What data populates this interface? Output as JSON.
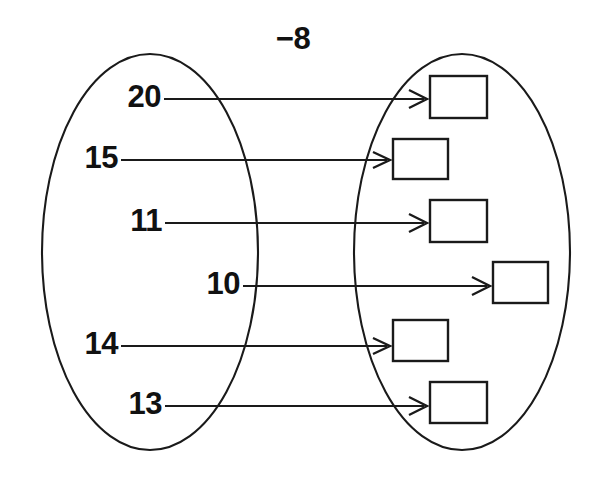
{
  "diagram": {
    "type": "mapping-diagram",
    "rule_label": "−8",
    "left_set": {
      "name": "input-set",
      "items": [
        {
          "label": "20",
          "label_x": 161,
          "label_y": 99,
          "line_y": 99,
          "line_x1": 164,
          "line_x2": 424
        },
        {
          "label": "15",
          "label_x": 118,
          "label_y": 160,
          "line_y": 160,
          "line_x1": 121,
          "line_x2": 387
        },
        {
          "label": "11",
          "label_x": 162,
          "label_y": 223,
          "line_y": 223,
          "line_x1": 165,
          "line_x2": 424
        },
        {
          "label": "10",
          "label_x": 240,
          "label_y": 286,
          "line_y": 286,
          "line_x1": 243,
          "line_x2": 487
        },
        {
          "label": "14",
          "label_x": 118,
          "label_y": 346,
          "line_y": 346,
          "line_x1": 121,
          "line_x2": 387
        },
        {
          "label": "13",
          "label_x": 162,
          "label_y": 406,
          "line_y": 406,
          "line_x1": 165,
          "line_x2": 424
        }
      ]
    },
    "right_set": {
      "name": "output-set",
      "boxes": [
        {
          "id": "output-box-1",
          "value": "",
          "x": 430,
          "y": 76,
          "w": 57,
          "h": 42
        },
        {
          "id": "output-box-2",
          "value": "",
          "x": 393,
          "y": 139,
          "w": 55,
          "h": 40
        },
        {
          "id": "output-box-3",
          "value": "",
          "x": 430,
          "y": 200,
          "w": 57,
          "h": 42
        },
        {
          "id": "output-box-4",
          "value": "",
          "x": 493,
          "y": 262,
          "w": 55,
          "h": 41
        },
        {
          "id": "output-box-5",
          "value": "",
          "x": 393,
          "y": 320,
          "w": 55,
          "h": 41
        },
        {
          "id": "output-box-6",
          "value": "",
          "x": 430,
          "y": 382,
          "w": 57,
          "h": 41
        }
      ]
    },
    "ellipses": {
      "left": {
        "cx": 150,
        "cy": 252,
        "rx": 108,
        "ry": 198
      },
      "right": {
        "cx": 462,
        "cy": 252,
        "rx": 108,
        "ry": 198
      }
    },
    "colors": {
      "stroke": "#1a1a1a",
      "text": "#111111",
      "background": "#ffffff"
    }
  }
}
